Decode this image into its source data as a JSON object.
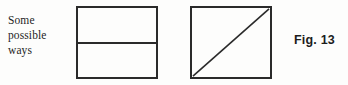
{
  "figure": {
    "background_color": "#fdfdfc",
    "ink_color": "#2a2a2a",
    "caption": {
      "lines": [
        "Some",
        "possible",
        "ways"
      ]
    },
    "label": {
      "text": "Fig. 13"
    },
    "diagrams": [
      {
        "name": "square-split-horizontal",
        "shape": "square",
        "partition": "horizontal-midline",
        "x": 76,
        "y": 6,
        "width": 82,
        "height": 73
      },
      {
        "name": "square-split-diagonal",
        "shape": "square",
        "partition": "diagonal-bottomleft-to-topright",
        "x": 190,
        "y": 6,
        "width": 82,
        "height": 73
      }
    ]
  }
}
